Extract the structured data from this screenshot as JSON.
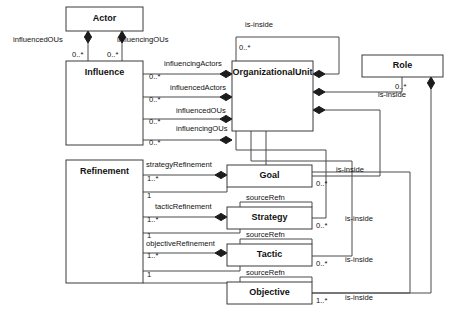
{
  "diagram": {
    "type": "uml-class-diagram",
    "stroke_color": "#3a3a3a",
    "fill_color": "#ffffff",
    "diamond_color": "#1c1c1c"
  },
  "classes": [
    {
      "id": "actor",
      "name": "Actor",
      "x": 66,
      "y": 7,
      "w": 77,
      "h": 24
    },
    {
      "id": "influence",
      "name": "Influence",
      "x": 66,
      "y": 61,
      "w": 77,
      "h": 84
    },
    {
      "id": "orgunit",
      "name": "OrganizationalUnit",
      "x": 232,
      "y": 61,
      "w": 81,
      "h": 70
    },
    {
      "id": "role",
      "name": "Role",
      "x": 362,
      "y": 55,
      "w": 81,
      "h": 22
    },
    {
      "id": "refinement",
      "name": "Refinement",
      "x": 66,
      "y": 160,
      "w": 77,
      "h": 123
    },
    {
      "id": "goal",
      "name": "Goal",
      "x": 227,
      "y": 165,
      "w": 85,
      "h": 22
    },
    {
      "id": "strategy",
      "name": "Strategy",
      "x": 227,
      "y": 207,
      "w": 85,
      "h": 22
    },
    {
      "id": "tactic",
      "name": "Tactic",
      "x": 227,
      "y": 244,
      "w": 85,
      "h": 22
    },
    {
      "id": "objective",
      "name": "Objective",
      "x": 227,
      "y": 282,
      "w": 85,
      "h": 22
    }
  ],
  "role_labels": [
    {
      "id": "influencedOUs-top",
      "text": "influencedOUs",
      "x": 13,
      "y": 42
    },
    {
      "id": "influencingOUs-top",
      "text": "influencingOUs",
      "x": 117,
      "y": 42
    },
    {
      "id": "influencingActors",
      "text": "influencingActors",
      "x": 164,
      "y": 66
    },
    {
      "id": "influencedActors",
      "text": "influencedActors",
      "x": 170,
      "y": 90
    },
    {
      "id": "influencedOUs-mid",
      "text": "influencedOUs",
      "x": 176,
      "y": 113
    },
    {
      "id": "influencingOUs-mid",
      "text": "influencingOUs",
      "x": 176,
      "y": 131
    },
    {
      "id": "is-inside-orgunit",
      "text": "is-inside",
      "x": 245,
      "y": 27
    },
    {
      "id": "is-inside-role",
      "text": "is-inside",
      "x": 378,
      "y": 97
    },
    {
      "id": "strategyRefinement",
      "text": "strategyRefinement",
      "x": 146,
      "y": 167
    },
    {
      "id": "tacticRefinement",
      "text": "tacticRefinement",
      "x": 155,
      "y": 209
    },
    {
      "id": "objectiveRefinement",
      "text": "objectiveRefinement",
      "x": 146,
      "y": 246
    },
    {
      "id": "sourceRefn-strategy",
      "text": "sourceRefn",
      "x": 246,
      "y": 200
    },
    {
      "id": "sourceRefn-tactic",
      "text": "sourceRefn",
      "x": 246,
      "y": 237
    },
    {
      "id": "sourceRefn-objective",
      "text": "sourceRefn",
      "x": 246,
      "y": 275
    },
    {
      "id": "is-inside-goal",
      "text": "is-inside",
      "x": 336,
      "y": 172
    },
    {
      "id": "is-inside-strategy",
      "text": "is-inside",
      "x": 345,
      "y": 221
    },
    {
      "id": "is-inside-tactic",
      "text": "is-inside",
      "x": 345,
      "y": 262
    },
    {
      "id": "is-inside-objective",
      "text": "is-inside",
      "x": 345,
      "y": 300
    }
  ],
  "multiplicity_labels": [
    {
      "id": "m-actor-left",
      "text": "0..*",
      "x": 72,
      "y": 57
    },
    {
      "id": "m-actor-right",
      "text": "0..*",
      "x": 107,
      "y": 57
    },
    {
      "id": "m-influencing-act",
      "text": "0..*",
      "x": 149,
      "y": 79
    },
    {
      "id": "m-influenced-act",
      "text": "0..*",
      "x": 149,
      "y": 102
    },
    {
      "id": "m-influenced-ous",
      "text": "0..*",
      "x": 149,
      "y": 124
    },
    {
      "id": "m-influencing-ous",
      "text": "0..*",
      "x": 149,
      "y": 145
    },
    {
      "id": "m-orgunit-inside",
      "text": "0..*",
      "x": 239,
      "y": 50
    },
    {
      "id": "m-role-inside",
      "text": "0..*",
      "x": 395,
      "y": 89
    },
    {
      "id": "m-strategyref-1s",
      "text": "1..*",
      "x": 147,
      "y": 181
    },
    {
      "id": "m-strategyref-1",
      "text": "1",
      "x": 147,
      "y": 198
    },
    {
      "id": "m-tacticref-1s",
      "text": "1..*",
      "x": 147,
      "y": 222
    },
    {
      "id": "m-tacticref-1",
      "text": "1",
      "x": 147,
      "y": 238
    },
    {
      "id": "m-objectiveref-1s",
      "text": "1..*",
      "x": 147,
      "y": 258
    },
    {
      "id": "m-objectiveref-1",
      "text": "1",
      "x": 147,
      "y": 277
    },
    {
      "id": "m-goal-inside",
      "text": "0..*",
      "x": 316,
      "y": 186
    },
    {
      "id": "m-strategy-inside",
      "text": "0..*",
      "x": 316,
      "y": 228
    },
    {
      "id": "m-tactic-inside",
      "text": "0..*",
      "x": 316,
      "y": 266
    },
    {
      "id": "m-objective-inside",
      "text": "1..*",
      "x": 316,
      "y": 303
    }
  ],
  "edges": [
    {
      "id": "actor-influence-left",
      "path": "M 88 31 L 88 61",
      "diamond": {
        "x": 88,
        "y": 37,
        "dir": "down"
      }
    },
    {
      "id": "actor-influence-right",
      "path": "M 122 31 L 122 61",
      "diamond": {
        "x": 122,
        "y": 37,
        "dir": "down"
      }
    },
    {
      "id": "influencingActors-edge",
      "path": "M 143 74 L 232 74",
      "diamond": {
        "x": 226,
        "y": 74,
        "dir": "right"
      }
    },
    {
      "id": "influencedActors-edge",
      "path": "M 143 97 L 232 97",
      "diamond": {
        "x": 226,
        "y": 97,
        "dir": "right"
      }
    },
    {
      "id": "influencedOUs-edge",
      "path": "M 143 119 L 232 119",
      "diamond": {
        "x": 226,
        "y": 119,
        "dir": "right"
      }
    },
    {
      "id": "influencingOUs-edge",
      "path": "M 143 140 L 232 140",
      "diamond": {
        "x": 226,
        "y": 140,
        "dir": "right"
      }
    },
    {
      "id": "orgunit-self-is-inside",
      "path": "M 236 61 L 236 37 L 339 37 L 339 74 L 313 74",
      "diamond": {
        "x": 319,
        "y": 74,
        "dir": "left"
      }
    },
    {
      "id": "role-orgunit-is-inside",
      "path": "M 402 77 L 402 92 L 313 92",
      "diamond": {
        "x": 319,
        "y": 92,
        "dir": "left"
      }
    },
    {
      "id": "goal-orgunit-is-inside",
      "path": "M 312 176 L 380 176 L 380 110 L 313 110",
      "diamond": {
        "x": 319,
        "y": 110,
        "dir": "left"
      }
    },
    {
      "id": "strategy-orgunit-is-inside",
      "path": "M 312 218 L 326 218 L 326 150 L 236 150 L 236 131",
      "diamond": {
        "x": 236,
        "y": 125,
        "dir": "up"
      }
    },
    {
      "id": "tactic-orgunit-is-inside",
      "path": "M 312 256 L 352 256 L 352 161 L 251 161 L 251 131",
      "diamond": {
        "x": 251,
        "y": 125,
        "dir": "up"
      }
    },
    {
      "id": "objective-orgunit-inside",
      "path": "M 312 293 L 410 293 L 410 172 L 266 172 L 266 131",
      "diamond": {
        "x": 266,
        "y": 125,
        "dir": "up"
      }
    },
    {
      "id": "role-vertical-inside",
      "path": "M 431 77 L 431 293 L 312 293",
      "diamond": {
        "x": 431,
        "y": 83,
        "dir": "down"
      }
    },
    {
      "id": "strategyRefinement-edge",
      "path": "M 143 175 L 227 175",
      "diamond": {
        "x": 221,
        "y": 175,
        "dir": "right"
      }
    },
    {
      "id": "goal-sourceRefn-edge",
      "path": "M 143 192 L 227 192 L 227 187"
    },
    {
      "id": "tacticRefinement-edge",
      "path": "M 143 217 L 227 217",
      "diamond": {
        "x": 221,
        "y": 217,
        "dir": "right"
      }
    },
    {
      "id": "strategy-sourceRefn-edge",
      "path": "M 143 233 L 240 233 L 240 202 L 312 202 L 312 207"
    },
    {
      "id": "objectiveRefinement-edge",
      "path": "M 143 253 L 227 253",
      "diamond": {
        "x": 221,
        "y": 253,
        "dir": "right"
      }
    },
    {
      "id": "tactic-sourceRefn-edge",
      "path": "M 143 271 L 240 271 L 240 239 L 312 239 L 312 244"
    },
    {
      "id": "objective-sourceRefn-edge",
      "path": "M 143 283 L 240 283 L 240 277 L 312 277 L 312 282"
    }
  ]
}
